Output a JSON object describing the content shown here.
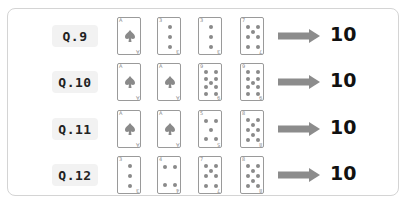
{
  "questions": [
    {
      "label": "Q.9",
      "cards": [
        "A",
        "3",
        "3",
        "7"
      ],
      "result": "10"
    },
    {
      "label": "Q.10",
      "cards": [
        "A",
        "A",
        "9",
        "9"
      ],
      "result": "10"
    },
    {
      "label": "Q.11",
      "cards": [
        "A",
        "A",
        "5",
        "8"
      ],
      "result": "10"
    },
    {
      "label": "Q.12",
      "cards": [
        "3",
        "4",
        "7",
        "8"
      ],
      "result": "10"
    }
  ],
  "suit": "spade",
  "colors": {
    "pip": "#8a8a8a",
    "arrow": "#8c8c8c",
    "border": "#d4d4d4",
    "label_bg": "#f2f2f2"
  }
}
